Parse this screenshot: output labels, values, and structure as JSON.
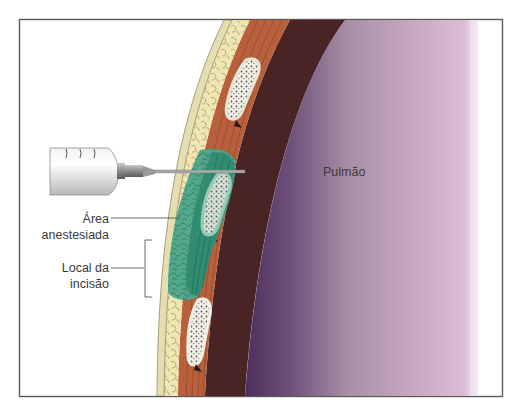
{
  "figure": {
    "type": "medical-illustration",
    "labels": {
      "anesthetized_area": [
        "Área",
        "anestesiada"
      ],
      "incision_site": [
        "Local da",
        "incisão"
      ],
      "lung": "Pulmão"
    },
    "colors": {
      "frame": "#5a5a5a",
      "skin": "#efe6b4",
      "skin_edge": "#c9b98a",
      "muscle": "#b8603c",
      "muscle_dark": "#8e4428",
      "intercostal": "#4a2424",
      "lung_dark": "#5a3a66",
      "lung_mid": "#9c84a0",
      "lung_light": "#d6b8d2",
      "anesthetic": "#2e8a70",
      "anesthetic_light": "#5fb59a",
      "rib_bone": "#f2f0e6",
      "syringe": "#d8d8d8",
      "needle": "#9a9a9a",
      "text": "#3a3a3a"
    }
  }
}
